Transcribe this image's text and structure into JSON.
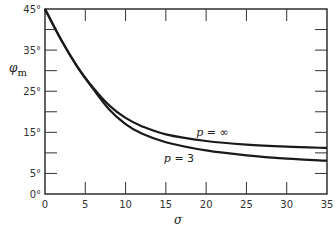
{
  "chart_data": {
    "type": "line",
    "title": "",
    "xlabel": "σ",
    "ylabel": "φm",
    "xlim": [
      0,
      35
    ],
    "ylim": [
      0,
      45
    ],
    "x_ticks": [
      "0",
      "5",
      "10",
      "15",
      "20",
      "25",
      "30",
      "35"
    ],
    "y_tick_labels": [
      "0°",
      "5°",
      "15°",
      "25°",
      "35°",
      "45°"
    ],
    "y_tick_values": [
      0,
      5,
      15,
      25,
      35,
      45
    ],
    "y_minor_ticks": [
      10,
      20,
      30,
      40
    ],
    "grid": false,
    "frame": "box",
    "x": [
      0,
      2,
      4,
      6,
      8,
      10,
      12,
      15,
      20,
      25,
      30,
      35
    ],
    "series": [
      {
        "name": "p = ∞",
        "label": "p = ∞",
        "values": [
          45,
          37.5,
          31,
          25.8,
          21.5,
          18.5,
          16.5,
          14.5,
          12.9,
          12.0,
          11.5,
          11.2
        ]
      },
      {
        "name": "p = 3",
        "label": "p = 3",
        "values": [
          45,
          37.5,
          31,
          25.5,
          20.5,
          17.0,
          14.7,
          12.6,
          10.6,
          9.4,
          8.6,
          8.1
        ]
      }
    ],
    "annotations": [
      {
        "text": "p = ∞",
        "x": 20,
        "y": 14.5
      },
      {
        "text": "p = 3",
        "x": 15,
        "y": 8.5
      }
    ]
  },
  "colors": {
    "line": "#1a1a1a",
    "frame": "#222222",
    "background": "#ffffff"
  }
}
